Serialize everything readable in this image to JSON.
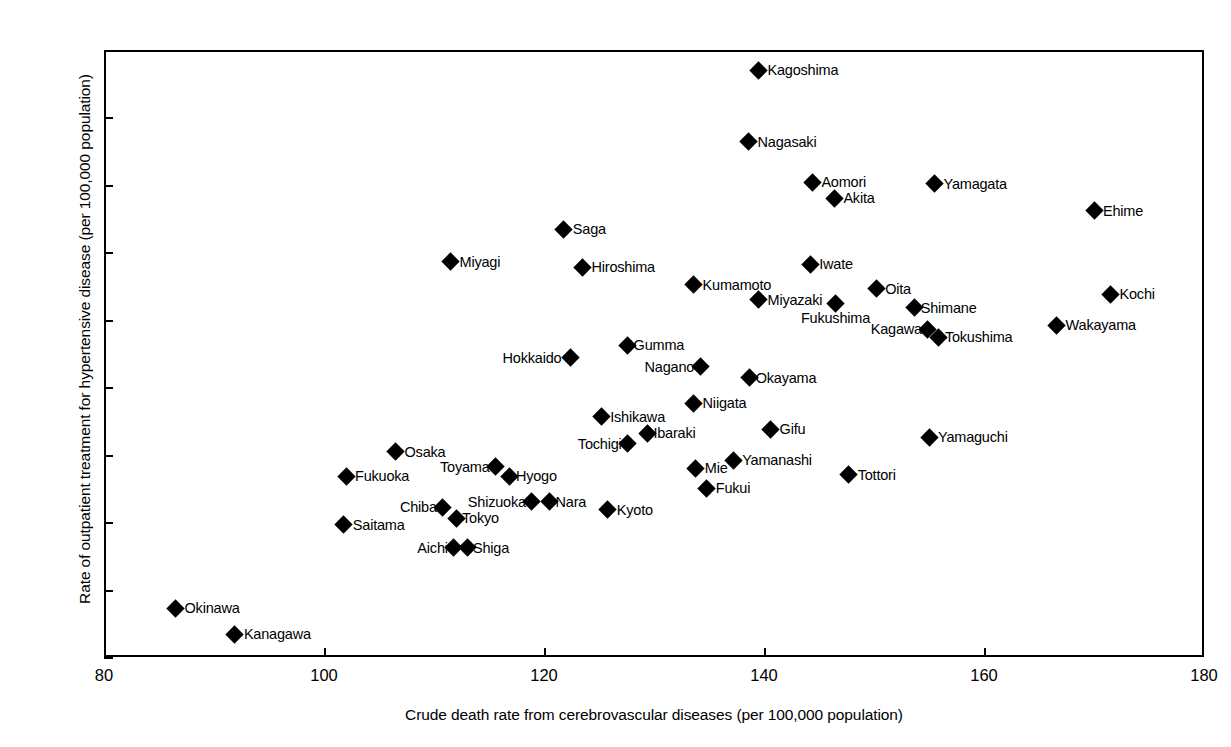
{
  "chart_data": {
    "type": "scatter",
    "title": "",
    "xlabel": "Crude death rate from cerebrovascular diseases (per 100,000 population)",
    "ylabel": "Rate of outpatient treatment for hypertensive disease (per 100,000 population)",
    "xlim": [
      80,
      180
    ],
    "ylim": [
      300,
      750
    ],
    "xticks": [
      80,
      100,
      120,
      140,
      160,
      180
    ],
    "yticks": [
      300,
      350,
      400,
      450,
      500,
      550,
      600,
      650,
      700,
      750
    ],
    "grid": false,
    "legend": null,
    "marker": "diamond",
    "marker_color": "#000000",
    "points": [
      {
        "label": "Kagoshima",
        "x": 139.5,
        "y": 735,
        "label_pos": "right"
      },
      {
        "label": "Nagasaki",
        "x": 138.6,
        "y": 682,
        "label_pos": "right"
      },
      {
        "label": "Aomori",
        "x": 144.4,
        "y": 652,
        "label_pos": "right"
      },
      {
        "label": "Yamagata",
        "x": 155.5,
        "y": 651,
        "label_pos": "right"
      },
      {
        "label": "Akita",
        "x": 146.4,
        "y": 640,
        "label_pos": "right"
      },
      {
        "label": "Ehime",
        "x": 170.0,
        "y": 631,
        "label_pos": "right"
      },
      {
        "label": "Saga",
        "x": 121.8,
        "y": 617,
        "label_pos": "right"
      },
      {
        "label": "Miyagi",
        "x": 111.5,
        "y": 593,
        "label_pos": "right"
      },
      {
        "label": "Iwate",
        "x": 144.2,
        "y": 591,
        "label_pos": "right"
      },
      {
        "label": "Hiroshima",
        "x": 123.5,
        "y": 589,
        "label_pos": "right"
      },
      {
        "label": "Kumamoto",
        "x": 133.6,
        "y": 576,
        "label_pos": "right"
      },
      {
        "label": "Oita",
        "x": 150.2,
        "y": 573,
        "label_pos": "right"
      },
      {
        "label": "Kochi",
        "x": 171.5,
        "y": 569,
        "label_pos": "right"
      },
      {
        "label": "Miyazaki",
        "x": 139.5,
        "y": 565,
        "label_pos": "right"
      },
      {
        "label": "Fukushima",
        "x": 146.5,
        "y": 562,
        "label_pos": "below"
      },
      {
        "label": "Shimane",
        "x": 153.7,
        "y": 559,
        "label_pos": "right-tight"
      },
      {
        "label": "Wakayama",
        "x": 166.6,
        "y": 546,
        "label_pos": "right"
      },
      {
        "label": "Kagawa",
        "x": 154.9,
        "y": 543,
        "label_pos": "left-tight"
      },
      {
        "label": "Tokushima",
        "x": 155.9,
        "y": 537,
        "label_pos": "right-tight"
      },
      {
        "label": "Gumma",
        "x": 127.6,
        "y": 531,
        "label_pos": "right-tight"
      },
      {
        "label": "Hokkaido",
        "x": 122.4,
        "y": 522,
        "label_pos": "left"
      },
      {
        "label": "Nagano",
        "x": 134.2,
        "y": 515,
        "label_pos": "left-tight"
      },
      {
        "label": "Okayama",
        "x": 138.7,
        "y": 507,
        "label_pos": "right-tight"
      },
      {
        "label": "Niigata",
        "x": 133.6,
        "y": 488,
        "label_pos": "right"
      },
      {
        "label": "Ishikawa",
        "x": 125.2,
        "y": 478,
        "label_pos": "right"
      },
      {
        "label": "Gifu",
        "x": 140.6,
        "y": 469,
        "label_pos": "right"
      },
      {
        "label": "Ibaraki",
        "x": 129.4,
        "y": 466,
        "label_pos": "right-tight"
      },
      {
        "label": "Yamaguchi",
        "x": 155.0,
        "y": 463,
        "label_pos": "right"
      },
      {
        "label": "Tochigi",
        "x": 127.6,
        "y": 458,
        "label_pos": "left-tight"
      },
      {
        "label": "Osaka",
        "x": 106.5,
        "y": 452,
        "label_pos": "right"
      },
      {
        "label": "Yamanashi",
        "x": 137.2,
        "y": 446,
        "label_pos": "right"
      },
      {
        "label": "Toyama",
        "x": 115.6,
        "y": 441,
        "label_pos": "left-tight"
      },
      {
        "label": "Mie",
        "x": 133.8,
        "y": 440,
        "label_pos": "right"
      },
      {
        "label": "Tottori",
        "x": 147.7,
        "y": 435,
        "label_pos": "right"
      },
      {
        "label": "Fukuoka",
        "x": 102.0,
        "y": 434,
        "label_pos": "right"
      },
      {
        "label": "Hyogo",
        "x": 116.9,
        "y": 434,
        "label_pos": "right-tight"
      },
      {
        "label": "Fukui",
        "x": 134.8,
        "y": 425,
        "label_pos": "right"
      },
      {
        "label": "Shizuoka",
        "x": 118.9,
        "y": 415,
        "label_pos": "left-tight"
      },
      {
        "label": "Nara",
        "x": 120.5,
        "y": 415,
        "label_pos": "right-tight"
      },
      {
        "label": "Chiba",
        "x": 110.8,
        "y": 411,
        "label_pos": "left-tight"
      },
      {
        "label": "Kyoto",
        "x": 125.8,
        "y": 409,
        "label_pos": "right"
      },
      {
        "label": "Tokyo",
        "x": 112.0,
        "y": 403,
        "label_pos": "right-tight"
      },
      {
        "label": "Saitama",
        "x": 101.8,
        "y": 398,
        "label_pos": "right"
      },
      {
        "label": "Aichi",
        "x": 111.8,
        "y": 381,
        "label_pos": "left-tight"
      },
      {
        "label": "Shiga",
        "x": 113.0,
        "y": 381,
        "label_pos": "right-tight"
      },
      {
        "label": "Okinawa",
        "x": 86.5,
        "y": 336,
        "label_pos": "right"
      },
      {
        "label": "Kanagawa",
        "x": 91.9,
        "y": 317,
        "label_pos": "right"
      }
    ]
  }
}
